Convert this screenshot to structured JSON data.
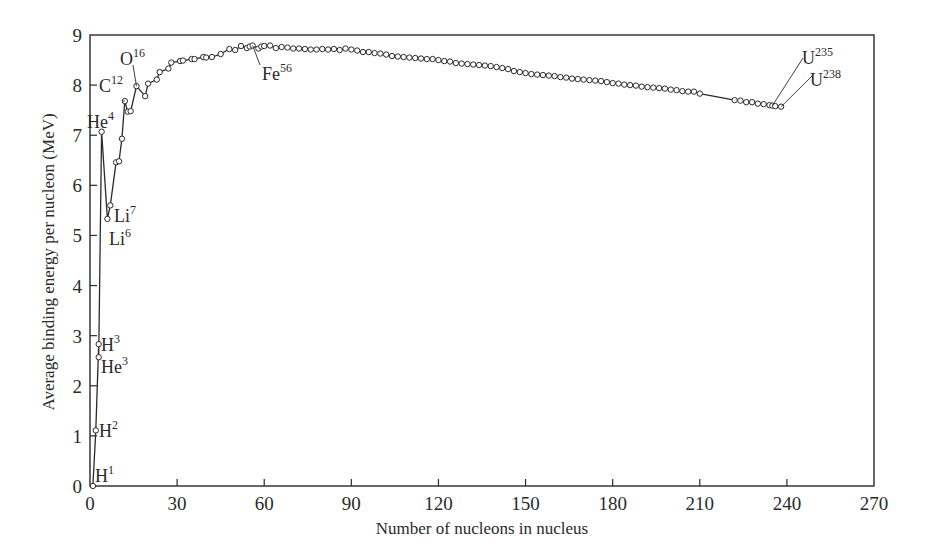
{
  "chart_data": {
    "type": "line",
    "title": "",
    "xlabel": "Number of nucleons in nucleus",
    "ylabel": "Average binding energy per nucleon (MeV)",
    "xlim": [
      0,
      270
    ],
    "ylim": [
      0,
      9
    ],
    "x_ticks": [
      0,
      30,
      60,
      90,
      120,
      150,
      180,
      210,
      240,
      270
    ],
    "y_ticks": [
      0,
      1,
      2,
      3,
      4,
      5,
      6,
      7,
      8,
      9
    ],
    "grid": false,
    "legend": null,
    "marker": "open-circle",
    "series": [
      {
        "name": "Binding energy per nucleon",
        "points": [
          [
            1,
            0.0
          ],
          [
            2,
            1.11
          ],
          [
            3,
            2.83
          ],
          [
            3,
            2.57
          ],
          [
            4,
            7.07
          ],
          [
            6,
            5.33
          ],
          [
            7,
            5.6
          ],
          [
            9,
            6.46
          ],
          [
            10,
            6.48
          ],
          [
            11,
            6.93
          ],
          [
            12,
            7.68
          ],
          [
            13,
            7.47
          ],
          [
            14,
            7.48
          ],
          [
            16,
            7.98
          ],
          [
            19,
            7.78
          ],
          [
            20,
            8.03
          ],
          [
            23,
            8.11
          ],
          [
            24,
            8.26
          ],
          [
            27,
            8.33
          ],
          [
            28,
            8.45
          ],
          [
            31,
            8.48
          ],
          [
            32,
            8.49
          ],
          [
            35,
            8.52
          ],
          [
            36,
            8.52
          ],
          [
            39,
            8.56
          ],
          [
            40,
            8.55
          ],
          [
            42,
            8.56
          ],
          [
            45,
            8.62
          ],
          [
            48,
            8.72
          ],
          [
            50,
            8.7
          ],
          [
            52,
            8.78
          ],
          [
            54,
            8.74
          ],
          [
            55,
            8.77
          ],
          [
            56,
            8.79
          ],
          [
            58,
            8.73
          ],
          [
            59,
            8.77
          ],
          [
            60,
            8.78
          ],
          [
            62,
            8.79
          ],
          [
            64,
            8.74
          ],
          [
            66,
            8.76
          ],
          [
            68,
            8.75
          ],
          [
            70,
            8.73
          ],
          [
            72,
            8.73
          ],
          [
            74,
            8.72
          ],
          [
            76,
            8.71
          ],
          [
            78,
            8.71
          ],
          [
            80,
            8.72
          ],
          [
            82,
            8.71
          ],
          [
            84,
            8.72
          ],
          [
            86,
            8.7
          ],
          [
            88,
            8.73
          ],
          [
            90,
            8.71
          ],
          [
            92,
            8.69
          ],
          [
            94,
            8.66
          ],
          [
            96,
            8.66
          ],
          [
            98,
            8.64
          ],
          [
            100,
            8.63
          ],
          [
            102,
            8.61
          ],
          [
            104,
            8.58
          ],
          [
            106,
            8.57
          ],
          [
            108,
            8.56
          ],
          [
            110,
            8.55
          ],
          [
            112,
            8.54
          ],
          [
            114,
            8.53
          ],
          [
            116,
            8.52
          ],
          [
            118,
            8.52
          ],
          [
            120,
            8.5
          ],
          [
            122,
            8.48
          ],
          [
            124,
            8.47
          ],
          [
            126,
            8.44
          ],
          [
            128,
            8.43
          ],
          [
            130,
            8.42
          ],
          [
            132,
            8.41
          ],
          [
            134,
            8.4
          ],
          [
            136,
            8.39
          ],
          [
            138,
            8.38
          ],
          [
            140,
            8.36
          ],
          [
            142,
            8.34
          ],
          [
            144,
            8.32
          ],
          [
            146,
            8.28
          ],
          [
            148,
            8.26
          ],
          [
            150,
            8.24
          ],
          [
            152,
            8.22
          ],
          [
            154,
            8.21
          ],
          [
            156,
            8.2
          ],
          [
            158,
            8.19
          ],
          [
            160,
            8.18
          ],
          [
            162,
            8.16
          ],
          [
            164,
            8.15
          ],
          [
            166,
            8.13
          ],
          [
            168,
            8.12
          ],
          [
            170,
            8.11
          ],
          [
            172,
            8.1
          ],
          [
            174,
            8.09
          ],
          [
            176,
            8.08
          ],
          [
            178,
            8.06
          ],
          [
            180,
            8.04
          ],
          [
            182,
            8.03
          ],
          [
            184,
            8.01
          ],
          [
            186,
            8.0
          ],
          [
            188,
            7.99
          ],
          [
            190,
            7.97
          ],
          [
            192,
            7.96
          ],
          [
            194,
            7.95
          ],
          [
            196,
            7.94
          ],
          [
            198,
            7.93
          ],
          [
            200,
            7.91
          ],
          [
            202,
            7.9
          ],
          [
            204,
            7.88
          ],
          [
            206,
            7.87
          ],
          [
            208,
            7.87
          ],
          [
            210,
            7.83
          ],
          [
            222,
            7.7
          ],
          [
            224,
            7.69
          ],
          [
            226,
            7.66
          ],
          [
            228,
            7.66
          ],
          [
            230,
            7.63
          ],
          [
            232,
            7.62
          ],
          [
            234,
            7.6
          ],
          [
            235,
            7.59
          ],
          [
            236,
            7.58
          ],
          [
            238,
            7.57
          ]
        ]
      }
    ],
    "annotations": [
      {
        "label": "H",
        "sup": "1",
        "x": 1,
        "y": 0.0
      },
      {
        "label": "H",
        "sup": "2",
        "x": 2,
        "y": 1.11
      },
      {
        "label": "H",
        "sup": "3",
        "x": 3,
        "y": 2.83
      },
      {
        "label": "He",
        "sup": "3",
        "x": 3,
        "y": 2.57
      },
      {
        "label": "He",
        "sup": "4",
        "x": 4,
        "y": 7.07
      },
      {
        "label": "Li",
        "sup": "6",
        "x": 6,
        "y": 5.33
      },
      {
        "label": "Li",
        "sup": "7",
        "x": 7,
        "y": 5.6
      },
      {
        "label": "C",
        "sup": "12",
        "x": 12,
        "y": 7.68
      },
      {
        "label": "O",
        "sup": "16",
        "x": 16,
        "y": 7.98
      },
      {
        "label": "Fe",
        "sup": "56",
        "x": 56,
        "y": 8.79
      },
      {
        "label": "U",
        "sup": "235",
        "x": 235,
        "y": 7.59
      },
      {
        "label": "U",
        "sup": "238",
        "x": 238,
        "y": 7.57
      }
    ]
  },
  "labels": {
    "xlabel": "Number of nucleons in nucleus",
    "ylabel": "Average binding energy per nucleon (MeV)"
  },
  "colors": {
    "line": "#2a2a2a",
    "marker_fill": "#ffffff",
    "background": "#ffffff"
  }
}
